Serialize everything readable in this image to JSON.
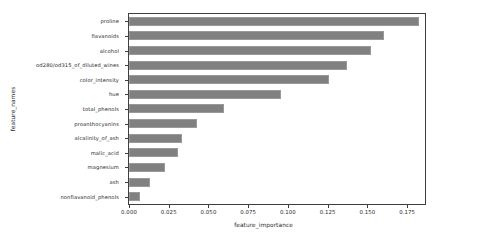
{
  "chart_data": {
    "type": "bar",
    "orientation": "horizontal",
    "title": "",
    "xlabel": "feature_importance",
    "ylabel": "feature_names",
    "xlim": [
      0.0,
      0.18625
    ],
    "xticks": [
      "0.000",
      "0.025",
      "0.050",
      "0.075",
      "0.100",
      "0.125",
      "0.150",
      "0.175"
    ],
    "xtick_values": [
      0.0,
      0.025,
      0.05,
      0.075,
      0.1,
      0.125,
      0.15,
      0.175
    ],
    "grid": false,
    "legend": false,
    "bar_color": "#808080",
    "bar_edge_color": "#9a9a9a",
    "axis_color": "#3f3f3f",
    "background": "#ffffff",
    "categories": [
      "proline",
      "flavanoids",
      "alcohol",
      "od280/od315_of_diluted_wines",
      "color_intensity",
      "hue",
      "total_phenols",
      "proanthocyanins",
      "alcalinity_of_ash",
      "malic_acid",
      "magnesium",
      "ash",
      "nonflavanoid_phenols"
    ],
    "values": [
      0.1825,
      0.1605,
      0.1525,
      0.1369,
      0.1256,
      0.0956,
      0.06,
      0.0425,
      0.0331,
      0.0306,
      0.0225,
      0.0131,
      0.0069
    ]
  }
}
